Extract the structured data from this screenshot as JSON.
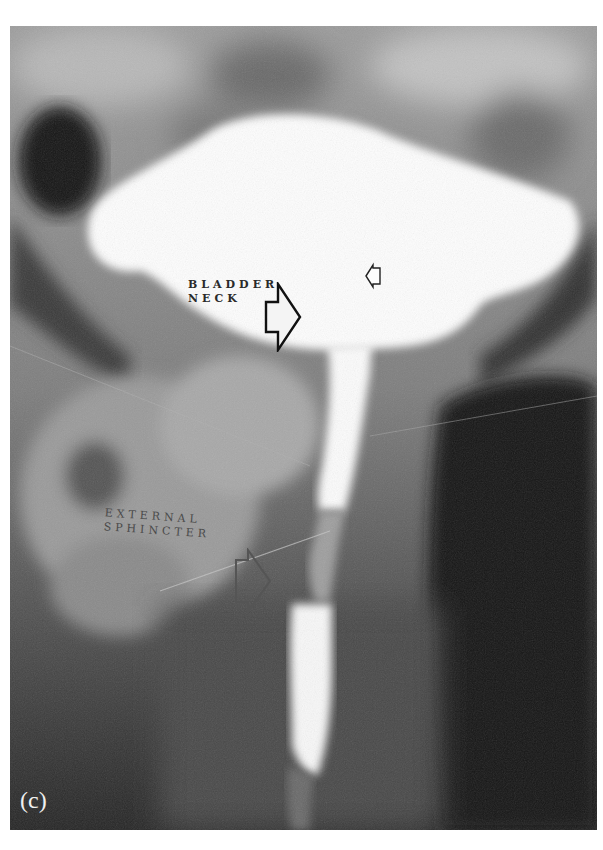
{
  "figure": {
    "panel_label": "(c)",
    "annotations": {
      "bladder_neck": {
        "line1": "BLADDER",
        "line2": "NECK"
      },
      "external_sphincter": {
        "line1": "EXTERNAL",
        "line2": "SPHINCTER"
      }
    },
    "arrows": [
      {
        "name": "bladder-neck-arrow",
        "direction": "right"
      },
      {
        "name": "small-bladder-arrow",
        "direction": "left"
      },
      {
        "name": "external-sphincter-arrow",
        "direction": "right"
      }
    ],
    "colors": {
      "background": "#ffffff",
      "contrast_fill": "#fdfdfd",
      "soft_tissue": "#8a8a8a",
      "dark_region": "#141414"
    }
  }
}
